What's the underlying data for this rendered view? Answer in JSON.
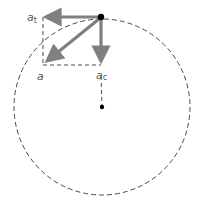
{
  "diagram": {
    "type": "acceleration-components-circular-motion",
    "labels": {
      "tangential": "a",
      "tangential_sub": "t",
      "total": "a",
      "centripetal": "a",
      "centripetal_sub": "c"
    },
    "colors": {
      "arrow": "#808080",
      "dashed": "#333333",
      "dot": "#000000",
      "label": "#555555",
      "background": "#ffffff"
    },
    "geometry": {
      "circle_center": [
        102,
        107
      ],
      "circle_radius": 88,
      "particle": [
        101,
        17
      ],
      "tangential_tip": [
        43,
        17
      ],
      "centripetal_tip": [
        101,
        64
      ],
      "total_tip": [
        45,
        63
      ]
    }
  }
}
